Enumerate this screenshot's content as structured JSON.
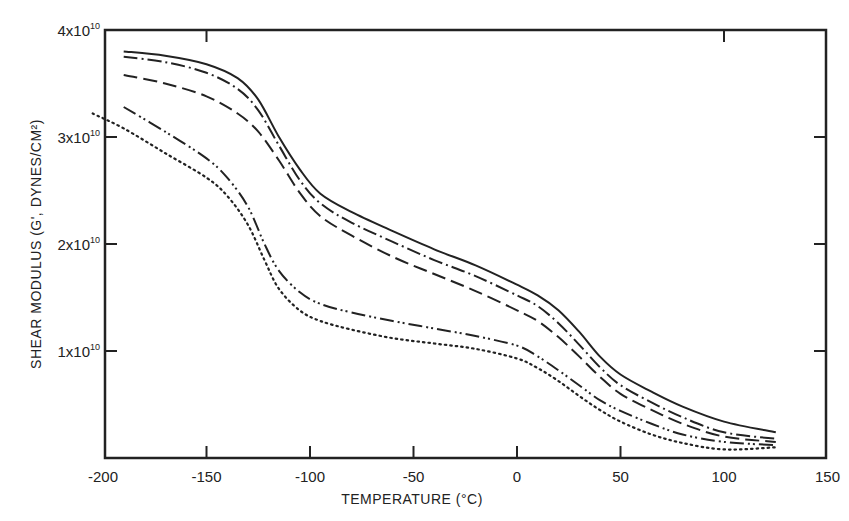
{
  "chart_data": {
    "type": "line",
    "title": "",
    "xlabel": "TEMPERATURE (°C)",
    "ylabel": "SHEAR MODULUS (G', DYNES/CM²)",
    "xlim": [
      -210,
      150
    ],
    "ylim": [
      0,
      40000000000.0
    ],
    "grid": false,
    "legend": "none",
    "x_ticks": [
      -200,
      -150,
      -100,
      -50,
      0,
      50,
      100,
      150
    ],
    "x_tick_labels": [
      "-200",
      "-150",
      "-100",
      "-50",
      "0",
      "50",
      "100",
      "150"
    ],
    "y_ticks": [
      10000000000.0,
      20000000000.0,
      30000000000.0,
      40000000000.0
    ],
    "y_tick_labels": [
      {
        "mantissa": "1x10",
        "exp": "10"
      },
      {
        "mantissa": "2x10",
        "exp": "10"
      },
      {
        "mantissa": "3x10",
        "exp": "10"
      },
      {
        "mantissa": "4x10",
        "exp": "10"
      }
    ],
    "series": [
      {
        "name": "solid",
        "style": "solid",
        "x": [
          -190,
          -170,
          -150,
          -135,
          -125,
          -115,
          -105,
          -95,
          -80,
          -60,
          -40,
          -20,
          0,
          10,
          20,
          30,
          40,
          50,
          65,
          80,
          100,
          125
        ],
        "y": [
          38000000000.0,
          37600000000.0,
          36800000000.0,
          35500000000.0,
          33500000000.0,
          30000000000.0,
          27000000000.0,
          24700000000.0,
          23000000000.0,
          21200000000.0,
          19500000000.0,
          18000000000.0,
          16200000000.0,
          15200000000.0,
          13800000000.0,
          11800000000.0,
          9500000000.0,
          7800000000.0,
          6200000000.0,
          4800000000.0,
          3400000000.0,
          2400000000.0
        ]
      },
      {
        "name": "dash-dot",
        "style": "dashdot",
        "x": [
          -190,
          -170,
          -150,
          -135,
          -125,
          -115,
          -105,
          -95,
          -80,
          -60,
          -40,
          -20,
          0,
          10,
          20,
          30,
          40,
          50,
          65,
          80,
          100,
          125
        ],
        "y": [
          37500000000.0,
          37000000000.0,
          36000000000.0,
          34500000000.0,
          32500000000.0,
          29200000000.0,
          26000000000.0,
          23800000000.0,
          22000000000.0,
          20200000000.0,
          18500000000.0,
          17000000000.0,
          15200000000.0,
          14200000000.0,
          12600000000.0,
          10600000000.0,
          8500000000.0,
          6800000000.0,
          5200000000.0,
          3800000000.0,
          2400000000.0,
          1800000000.0
        ]
      },
      {
        "name": "long-dash",
        "style": "dashed",
        "x": [
          -190,
          -170,
          -150,
          -135,
          -125,
          -115,
          -105,
          -95,
          -80,
          -60,
          -40,
          -20,
          0,
          10,
          20,
          30,
          40,
          50,
          65,
          80,
          100,
          125
        ],
        "y": [
          35800000000.0,
          35000000000.0,
          33800000000.0,
          32200000000.0,
          30500000000.0,
          27800000000.0,
          24800000000.0,
          22600000000.0,
          20800000000.0,
          18800000000.0,
          17200000000.0,
          15600000000.0,
          13800000000.0,
          12800000000.0,
          11300000000.0,
          9500000000.0,
          7600000000.0,
          6000000000.0,
          4500000000.0,
          3200000000.0,
          2000000000.0,
          1500000000.0
        ]
      },
      {
        "name": "dash-dot-dot",
        "style": "dashdotdot",
        "x": [
          -190,
          -170,
          -150,
          -140,
          -130,
          -122,
          -115,
          -105,
          -95,
          -80,
          -60,
          -40,
          -20,
          0,
          10,
          20,
          30,
          40,
          50,
          65,
          80,
          100,
          125
        ],
        "y": [
          32800000000.0,
          30500000000.0,
          28000000000.0,
          26200000000.0,
          23500000000.0,
          20000000000.0,
          17500000000.0,
          15500000000.0,
          14400000000.0,
          13600000000.0,
          12800000000.0,
          12100000000.0,
          11400000000.0,
          10500000000.0,
          9500000000.0,
          8200000000.0,
          6800000000.0,
          5400000000.0,
          4400000000.0,
          3200000000.0,
          2200000000.0,
          1500000000.0,
          1200000000.0
        ]
      },
      {
        "name": "dotted",
        "style": "dotted",
        "x": [
          -205,
          -190,
          -170,
          -150,
          -140,
          -130,
          -122,
          -115,
          -105,
          -95,
          -80,
          -60,
          -40,
          -20,
          0,
          10,
          20,
          30,
          40,
          50,
          65,
          80,
          100,
          125
        ],
        "y": [
          32200000000.0,
          30800000000.0,
          28500000000.0,
          26200000000.0,
          24500000000.0,
          21800000000.0,
          18500000000.0,
          15800000000.0,
          13800000000.0,
          12800000000.0,
          12000000000.0,
          11200000000.0,
          10700000000.0,
          10200000000.0,
          9300000000.0,
          8400000000.0,
          7200000000.0,
          5800000000.0,
          4500000000.0,
          3400000000.0,
          2200000000.0,
          1400000000.0,
          800000000.0,
          1000000000.0
        ]
      }
    ]
  },
  "colors": {
    "ink": "#222222",
    "background": "#ffffff"
  }
}
